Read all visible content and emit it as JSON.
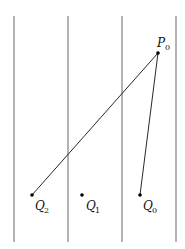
{
  "diagram": {
    "vertical_lines": [
      {
        "x": 14,
        "y1": 16,
        "y2": 242
      },
      {
        "x": 68,
        "y1": 16,
        "y2": 242
      },
      {
        "x": 122,
        "y1": 16,
        "y2": 242
      },
      {
        "x": 176,
        "y1": 16,
        "y2": 242
      }
    ],
    "points": {
      "P0": {
        "label": "P",
        "sub": "0",
        "x": 158,
        "y": 53
      },
      "Q2": {
        "label": "Q",
        "sub": "2",
        "x": 32,
        "y": 195
      },
      "Q1": {
        "label": "Q",
        "sub": "1",
        "x": 82,
        "y": 195
      },
      "Q0": {
        "label": "Q",
        "sub": "0",
        "x": 140,
        "y": 195
      }
    },
    "segments": [
      {
        "from": "P0",
        "to": "Q2"
      },
      {
        "from": "P0",
        "to": "Q0"
      }
    ]
  }
}
